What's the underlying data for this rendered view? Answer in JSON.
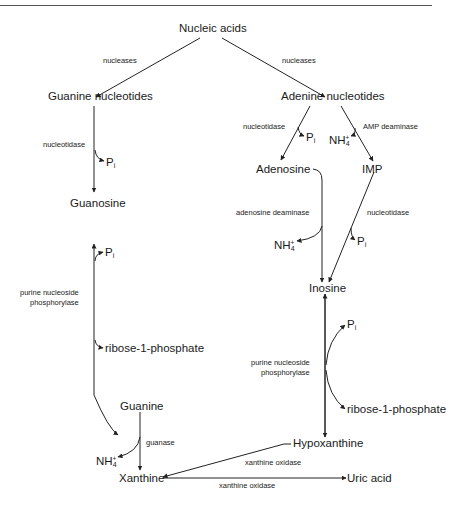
{
  "diagram": {
    "type": "metabolic-pathway",
    "nodes": {
      "nucleic_acids": "Nucleic acids",
      "guanine_nucleotides": "Guanine nucleotides",
      "adenine_nucleotides": "Adenine nucleotides",
      "guanosine": "Guanosine",
      "adenosine": "Adenosine",
      "imp": "IMP",
      "inosine": "Inosine",
      "guanine": "Guanine",
      "hypoxanthine": "Hypoxanthine",
      "xanthine": "Xanthine",
      "uric_acid": "Uric acid"
    },
    "byproducts": {
      "pi_label": "P",
      "pi_sub": "i",
      "nh4_label": "NH",
      "nh4_sub": "4",
      "nh4_sup": "+",
      "ribose_1_phosphate": "ribose-1-phosphate"
    },
    "enzymes": {
      "nucleases_left": "nucleases",
      "nucleases_right": "nucleases",
      "nucleotidase_guanine": "nucleotidase",
      "nucleotidase_adenine": "nucleotidase",
      "amp_deaminase": "AMP deaminase",
      "adenosine_deaminase": "adenosine deaminase",
      "nucleotidase_imp": "nucleotidase",
      "pnp_left_line1": "purine nucleoside",
      "pnp_left_line2": "phosphorylase",
      "pnp_right_line1": "purine nucleoside",
      "pnp_right_line2": "phosphorylase",
      "guanase": "guanase",
      "xanthine_oxidase_hypo": "xanthine oxidase",
      "xanthine_oxidase_uric": "xanthine oxidase"
    },
    "edges": [
      {
        "from": "Nucleic acids",
        "to": "Guanine nucleotides",
        "enzyme": "nucleases"
      },
      {
        "from": "Nucleic acids",
        "to": "Adenine nucleotides",
        "enzyme": "nucleases"
      },
      {
        "from": "Guanine nucleotides",
        "to": "Guanosine",
        "enzyme": "nucleotidase",
        "releases": "Pi"
      },
      {
        "from": "Adenine nucleotides",
        "to": "Adenosine",
        "enzyme": "nucleotidase",
        "releases": "Pi"
      },
      {
        "from": "Adenine nucleotides",
        "to": "IMP",
        "enzyme": "AMP deaminase",
        "releases": "NH4+"
      },
      {
        "from": "Adenosine",
        "to": "Inosine",
        "enzyme": "adenosine deaminase",
        "releases": "NH4+"
      },
      {
        "from": "IMP",
        "to": "Inosine",
        "enzyme": "nucleotidase",
        "releases": "Pi"
      },
      {
        "from": "Guanosine",
        "to": "Guanine",
        "enzyme": "purine nucleoside phosphorylase",
        "consumes": "Pi",
        "releases": "ribose-1-phosphate",
        "reversible": true
      },
      {
        "from": "Inosine",
        "to": "Hypoxanthine",
        "enzyme": "purine nucleoside phosphorylase",
        "consumes": "Pi",
        "releases": "ribose-1-phosphate",
        "reversible": true
      },
      {
        "from": "Guanine",
        "to": "Xanthine",
        "enzyme": "guanase",
        "releases": "NH4+"
      },
      {
        "from": "Hypoxanthine",
        "to": "Xanthine",
        "enzyme": "xanthine oxidase"
      },
      {
        "from": "Xanthine",
        "to": "Uric acid",
        "enzyme": "xanthine oxidase"
      }
    ]
  }
}
